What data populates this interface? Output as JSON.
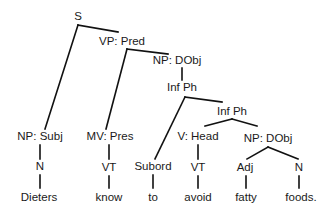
{
  "diagram": {
    "type": "sentence-diagram",
    "sentence": "Dieters know to avoid fatty foods.",
    "line_color": "#111111",
    "text_color": "#1a1a1a",
    "nodes": [
      {
        "id": "s",
        "label": "S",
        "x": 78,
        "y": 17
      },
      {
        "id": "vp-pred",
        "label": "VP: Pred",
        "x": 122,
        "y": 42
      },
      {
        "id": "np-dobj-1",
        "label": "NP: DObj",
        "x": 177,
        "y": 61
      },
      {
        "id": "inf-ph-1",
        "label": "Inf Ph",
        "x": 182,
        "y": 88
      },
      {
        "id": "inf-ph-2",
        "label": "Inf Ph",
        "x": 232,
        "y": 112
      },
      {
        "id": "np-subj",
        "label": "NP: Subj",
        "x": 40,
        "y": 137
      },
      {
        "id": "mv-pres",
        "label": "MV: Pres",
        "x": 110,
        "y": 137
      },
      {
        "id": "v-head",
        "label": "V: Head",
        "x": 198,
        "y": 137
      },
      {
        "id": "np-dobj-2",
        "label": "NP: DObj",
        "x": 268,
        "y": 139
      },
      {
        "id": "subord",
        "label": "Subord",
        "x": 153,
        "y": 167
      },
      {
        "id": "n-1",
        "label": "N",
        "x": 40,
        "y": 167
      },
      {
        "id": "vt-1",
        "label": "VT",
        "x": 109,
        "y": 168
      },
      {
        "id": "vt-2",
        "label": "VT",
        "x": 198,
        "y": 168
      },
      {
        "id": "adj",
        "label": "Adj",
        "x": 245,
        "y": 168
      },
      {
        "id": "n-2",
        "label": "N",
        "x": 299,
        "y": 168
      },
      {
        "id": "word-dieters",
        "label": "Dieters",
        "x": 39,
        "y": 198
      },
      {
        "id": "word-know",
        "label": "know",
        "x": 109,
        "y": 198
      },
      {
        "id": "word-to",
        "label": "to",
        "x": 153,
        "y": 198
      },
      {
        "id": "word-avoid",
        "label": "avoid",
        "x": 198,
        "y": 198
      },
      {
        "id": "word-fatty",
        "label": "fatty",
        "x": 246,
        "y": 198
      },
      {
        "id": "word-foods",
        "label": "foods.",
        "x": 301,
        "y": 198
      }
    ]
  }
}
